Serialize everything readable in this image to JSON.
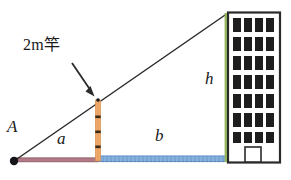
{
  "figure": {
    "labels": {
      "pole_annotation": "2m竿",
      "vertex_A": "A",
      "segment_a": "a",
      "segment_b": "b",
      "height_h": "h"
    },
    "colors": {
      "ground_near": "#b07a86",
      "ground_far": "#7ba7d7",
      "pole": "#f0a96a",
      "pole_tick": "#3a2a18",
      "height_line": "#9cbf62",
      "line_stroke": "#2b2b2b",
      "building_outline": "#2b2b2b",
      "window_fill": "#1e1e1e",
      "background": "#ffffff"
    },
    "geometry": {
      "point_A": [
        14,
        161
      ],
      "pole_base": [
        98,
        161
      ],
      "pole_top": [
        98,
        100
      ],
      "building_base": [
        228,
        161
      ],
      "building_top": [
        228,
        13
      ],
      "segment_a_range": [
        14,
        98
      ],
      "segment_b_range": [
        98,
        228
      ]
    },
    "building": {
      "window_rows": 7,
      "window_columns": 4,
      "has_door": true
    }
  }
}
